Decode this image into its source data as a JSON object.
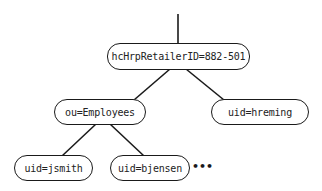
{
  "diagram": {
    "type": "directory-tree",
    "nodes": {
      "root": {
        "label": "hcHrpRetailerID=882-501"
      },
      "employees": {
        "label": "ou=Employees"
      },
      "hreming": {
        "label": "uid=hreming"
      },
      "jsmith": {
        "label": "uid=jsmith"
      },
      "bjensen": {
        "label": "uid=bjensen"
      }
    },
    "edges": [
      {
        "from": "parent",
        "to": "root"
      },
      {
        "from": "root",
        "to": "employees"
      },
      {
        "from": "root",
        "to": "hreming"
      },
      {
        "from": "employees",
        "to": "jsmith"
      },
      {
        "from": "employees",
        "to": "bjensen"
      }
    ],
    "continuation": "•••",
    "colors": {
      "stroke": "#1a1a1a",
      "text": "#222222",
      "background": "#ffffff"
    }
  }
}
